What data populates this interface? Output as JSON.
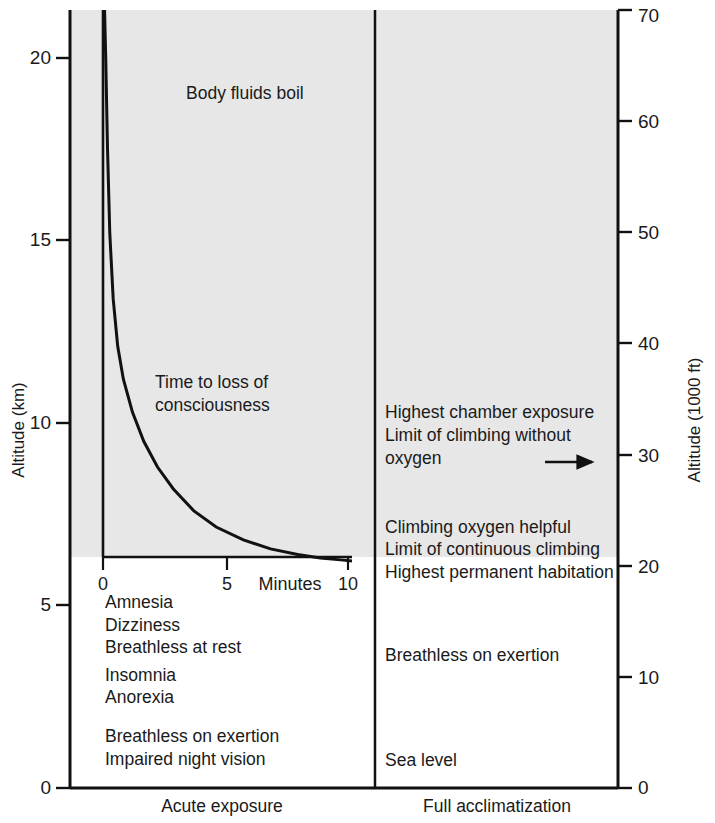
{
  "chart_data": {
    "type": "line",
    "title": "",
    "background_shade_color": "#e7e7e7",
    "axis_color": "#111111",
    "left_axis": {
      "label": "Altitude (km)",
      "ticks": [
        0,
        5,
        10,
        15,
        20
      ],
      "range": [
        0,
        21.8
      ],
      "unit": "km"
    },
    "right_axis": {
      "label": "Altitude (1000 ft)",
      "ticks": [
        0,
        10,
        20,
        30,
        40,
        50,
        60,
        70
      ],
      "range": [
        0,
        71.5
      ],
      "unit": "1000 ft"
    },
    "panels": [
      {
        "id": "acute",
        "caption": "Acute exposure"
      },
      {
        "id": "acclimatized",
        "caption": "Full acclimatization"
      }
    ],
    "inset": {
      "xlabel": "Minutes",
      "xticks": [
        0,
        5,
        10
      ],
      "xlim": [
        0,
        11
      ],
      "curve_label_line1": "Time to loss of",
      "curve_label_line2": "consciousness",
      "asymptote_km": 6.2,
      "description": "Time to loss of consciousness decays hyperbolically with altitude",
      "points": [
        {
          "minutes": 0.05,
          "altitude_km": 21.8
        },
        {
          "minutes": 0.12,
          "altitude_km": 20.0
        },
        {
          "minutes": 0.2,
          "altitude_km": 17.5
        },
        {
          "minutes": 0.3,
          "altitude_km": 15.2
        },
        {
          "minutes": 0.45,
          "altitude_km": 13.4
        },
        {
          "minutes": 0.65,
          "altitude_km": 12.1
        },
        {
          "minutes": 0.9,
          "altitude_km": 11.2
        },
        {
          "minutes": 1.3,
          "altitude_km": 10.3
        },
        {
          "minutes": 1.8,
          "altitude_km": 9.5
        },
        {
          "minutes": 2.4,
          "altitude_km": 8.8
        },
        {
          "minutes": 3.1,
          "altitude_km": 8.2
        },
        {
          "minutes": 4.0,
          "altitude_km": 7.6
        },
        {
          "minutes": 5.0,
          "altitude_km": 7.15
        },
        {
          "minutes": 6.2,
          "altitude_km": 6.8
        },
        {
          "minutes": 7.4,
          "altitude_km": 6.55
        },
        {
          "minutes": 8.6,
          "altitude_km": 6.4
        },
        {
          "minutes": 9.6,
          "altitude_km": 6.3
        },
        {
          "minutes": 10.5,
          "altitude_km": 6.25
        },
        {
          "minutes": 11.0,
          "altitude_km": 6.22
        }
      ]
    },
    "annotations_left": [
      {
        "text": "Body fluids boil",
        "altitude_km": 19.3
      },
      {
        "text": "Amnesia",
        "altitude_km": 5.05
      },
      {
        "text": "Dizziness",
        "altitude_km": 4.42
      },
      {
        "text": "Breathless at rest",
        "altitude_km": 3.82
      },
      {
        "text": "Insomnia",
        "altitude_km": 3.06
      },
      {
        "text": "Anorexia",
        "altitude_km": 2.47
      },
      {
        "text": "Breathless on exertion",
        "altitude_km": 1.4
      },
      {
        "text": "Impaired night vision",
        "altitude_km": 0.78
      }
    ],
    "annotations_right": [
      {
        "text": "Highest chamber exposure",
        "altitude_km": 10.15
      },
      {
        "text": "Limit of climbing without",
        "altitude_km": 9.52
      },
      {
        "text": "oxygen",
        "altitude_km": 8.9
      },
      {
        "text": "Climbing oxygen helpful",
        "altitude_km": 7.0
      },
      {
        "text": "Limit of continuous climbing",
        "altitude_km": 6.4
      },
      {
        "text": "Highest permanent habitation",
        "altitude_km": 5.78
      },
      {
        "text": "Breathless on exertion",
        "altitude_km": 3.52
      },
      {
        "text": "Sea level",
        "altitude_km": 0.62
      }
    ],
    "arrow": {
      "name": "upward-limit-arrow",
      "direction": "right",
      "altitude_km": 9.15
    }
  }
}
